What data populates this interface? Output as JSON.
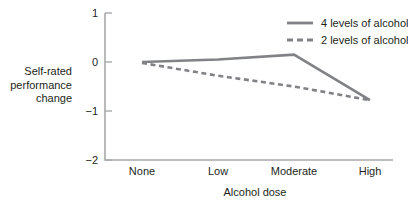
{
  "chart_data": {
    "type": "line",
    "title": "",
    "xlabel": "Alcohol dose",
    "ylabel": "Self-rated performance change",
    "categories": [
      "None",
      "Low",
      "Moderate",
      "High"
    ],
    "ylim": [
      -2,
      1
    ],
    "yticks": [
      1,
      0,
      -1,
      -2
    ],
    "ytick_labels": [
      "1",
      "0",
      "−1",
      "−2"
    ],
    "grid": false,
    "legend_position": "top-right",
    "series": [
      {
        "name": "4 levels of alcohol",
        "style": "solid",
        "color": "#808285",
        "values": [
          0.0,
          0.05,
          0.15,
          -0.78
        ]
      },
      {
        "name": "2 levels of alcohol",
        "style": "dashed",
        "color": "#808285",
        "values": [
          -0.02,
          -0.28,
          -0.5,
          -0.78
        ]
      }
    ]
  },
  "axis": {
    "y_title_line1": "Self-rated",
    "y_title_line2": "performance",
    "y_title_line3": "change",
    "x_title": "Alcohol dose"
  },
  "ticks": {
    "y": [
      "1",
      "0",
      "−1",
      "−2"
    ],
    "x": [
      "None",
      "Low",
      "Moderate",
      "High"
    ]
  },
  "legend": {
    "entries": [
      {
        "label": "4 levels of alcohol",
        "style": "solid"
      },
      {
        "label": "2 levels of alcohol",
        "style": "dashed"
      }
    ]
  }
}
